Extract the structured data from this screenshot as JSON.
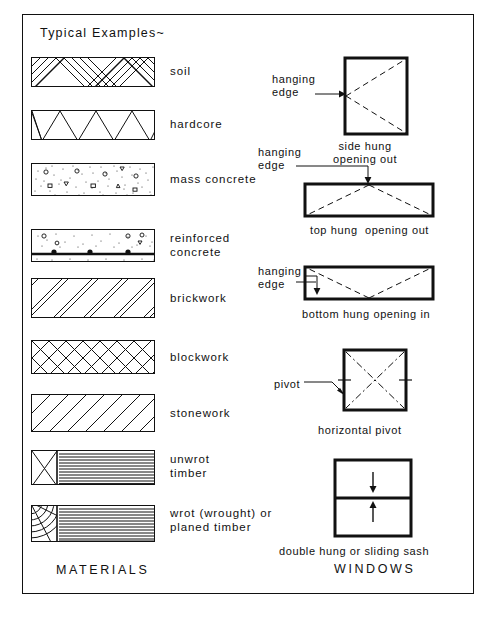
{
  "sheet": {
    "title": "Typical Examples~",
    "materials_heading": "MATERIALS",
    "windows_heading": "WINDOWS",
    "ink_color": "#111111",
    "paper_color": "#ffffff"
  },
  "materials": {
    "items": [
      {
        "id": "soil",
        "label": "soil",
        "pattern": "herringbone-diagonal-bands"
      },
      {
        "id": "hardcore",
        "label": "hardcore",
        "pattern": "zigzag-triangles"
      },
      {
        "id": "mass-concrete",
        "label": "mass concrete",
        "pattern": "stipple-with-aggregate"
      },
      {
        "id": "reinforced-concrete",
        "label": "reinforced\nconcrete",
        "pattern": "stipple-with-rebar-line"
      },
      {
        "id": "brickwork",
        "label": "brickwork",
        "pattern": "paired-diagonal-lines"
      },
      {
        "id": "blockwork",
        "label": "blockwork",
        "pattern": "diagonal-cross-hatch"
      },
      {
        "id": "stonework",
        "label": "stonework",
        "pattern": "single-diagonal-lines"
      },
      {
        "id": "unwrot-timber",
        "label": "unwrot\ntimber",
        "pattern": "grain-lines-with-x-end"
      },
      {
        "id": "wrot-timber",
        "label": "wrot (wrought) or\nplaned timber",
        "pattern": "grain-lines-with-arc-end"
      }
    ]
  },
  "windows": {
    "items": [
      {
        "id": "side-hung",
        "caption": "side hung\nopening out",
        "leader": "hanging\nedge"
      },
      {
        "id": "top-hung",
        "caption": "top hung  opening out",
        "leader": "hanging\nedge"
      },
      {
        "id": "bottom-hung",
        "caption": "bottom hung opening in",
        "leader": "hanging\nedge"
      },
      {
        "id": "horizontal-pivot",
        "caption": "horizontal pivot",
        "leader": "pivot"
      },
      {
        "id": "double-hung",
        "caption": "double hung or sliding sash",
        "leader": ""
      }
    ]
  }
}
